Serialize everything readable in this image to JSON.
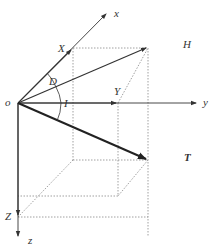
{
  "diagram": {
    "type": "geomagnetic-field-components",
    "labels": {
      "origin": "o",
      "x_axis": "x",
      "y_axis": "y",
      "z_axis": "z",
      "X": "X",
      "Y": "Y",
      "Z": "Z",
      "H": "H",
      "T": "T",
      "D": "D",
      "I": "I"
    },
    "colors": {
      "axis": "#333333",
      "vector_bold": "#222222",
      "dotted": "#888888"
    }
  }
}
